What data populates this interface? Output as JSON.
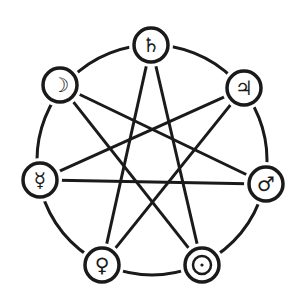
{
  "diagram": {
    "type": "heptagram",
    "stroke_color": "#1a1a1a",
    "background": "#ffffff",
    "outer_circle": {
      "cx": 152,
      "cy": 160,
      "r": 115
    },
    "node_radius": 17,
    "nodes": [
      {
        "id": "saturn",
        "name": "Saturn",
        "symbol": "♄",
        "x": 151,
        "y": 45
      },
      {
        "id": "jupiter",
        "name": "Jupiter",
        "symbol": "♃",
        "x": 244,
        "y": 88
      },
      {
        "id": "mars",
        "name": "Mars",
        "symbol": "♂",
        "x": 266,
        "y": 184
      },
      {
        "id": "sun",
        "name": "Sun",
        "symbol": "☉",
        "x": 202,
        "y": 265
      },
      {
        "id": "venus",
        "name": "Venus",
        "symbol": "♀",
        "x": 102,
        "y": 265
      },
      {
        "id": "mercury",
        "name": "Mercury",
        "symbol": "☿",
        "x": 40,
        "y": 180
      },
      {
        "id": "moon",
        "name": "Moon",
        "symbol": "☽",
        "x": 60,
        "y": 85
      }
    ],
    "edges": [
      [
        "saturn",
        "venus"
      ],
      [
        "saturn",
        "sun"
      ],
      [
        "jupiter",
        "mercury"
      ],
      [
        "jupiter",
        "venus"
      ],
      [
        "mars",
        "moon"
      ],
      [
        "mars",
        "mercury"
      ],
      [
        "sun",
        "moon"
      ]
    ]
  }
}
